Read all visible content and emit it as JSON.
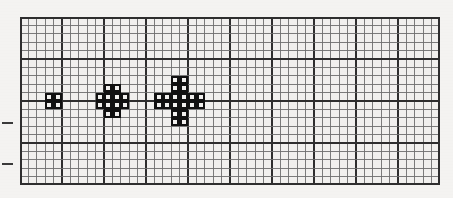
{
  "figure": {
    "background_color": "#f4f3f1",
    "grid": {
      "cols": 50,
      "rows": 20,
      "cell_size_px": 8.4,
      "origin_x_px": 20,
      "origin_y_px": 17,
      "minor_line_color": "#6e6e6e",
      "major_line_color": "#2e2e2e",
      "major_every": 5,
      "border_color": "#2e2e2e"
    },
    "shape_color": "#111111",
    "shape_stroke_px": 2.2,
    "shapes": [
      {
        "name": "square-2x2",
        "label": "2 by 2 square",
        "origin_col": 3,
        "origin_row": 9,
        "cells": [
          [
            0,
            0
          ],
          [
            1,
            0
          ],
          [
            0,
            1
          ],
          [
            1,
            1
          ]
        ]
      },
      {
        "name": "diamond-octagon",
        "label": "diamond / octagon",
        "origin_col": 9,
        "origin_row": 8,
        "cells": [
          [
            1,
            0
          ],
          [
            2,
            0
          ],
          [
            0,
            1
          ],
          [
            1,
            1
          ],
          [
            2,
            1
          ],
          [
            3,
            1
          ],
          [
            0,
            2
          ],
          [
            1,
            2
          ],
          [
            2,
            2
          ],
          [
            3,
            2
          ],
          [
            1,
            3
          ],
          [
            2,
            3
          ]
        ]
      },
      {
        "name": "plus-cross",
        "label": "plus / cross",
        "origin_col": 16,
        "origin_row": 7,
        "cells": [
          [
            2,
            0
          ],
          [
            3,
            0
          ],
          [
            2,
            1
          ],
          [
            3,
            1
          ],
          [
            0,
            2
          ],
          [
            1,
            2
          ],
          [
            2,
            2
          ],
          [
            3,
            2
          ],
          [
            4,
            2
          ],
          [
            5,
            2
          ],
          [
            0,
            3
          ],
          [
            1,
            3
          ],
          [
            2,
            3
          ],
          [
            3,
            3
          ],
          [
            4,
            3
          ],
          [
            5,
            3
          ],
          [
            2,
            4
          ],
          [
            3,
            4
          ],
          [
            2,
            5
          ],
          [
            3,
            5
          ]
        ]
      }
    ],
    "ticks": [
      {
        "name": "margin-tick-upper",
        "x_px": 2,
        "y_px": 122,
        "width_px": 11,
        "height_px": 2
      },
      {
        "name": "margin-tick-lower",
        "x_px": 2,
        "y_px": 163,
        "width_px": 11,
        "height_px": 2
      }
    ]
  }
}
